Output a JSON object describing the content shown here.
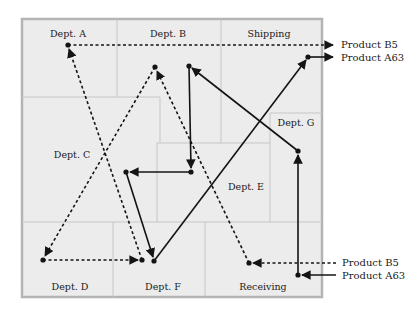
{
  "diagram": {
    "title": "",
    "colors": {
      "floor": "#ececec",
      "border": "#b4b4b4",
      "walls": "#c8c8c8",
      "path": "#141414"
    },
    "departments": [
      {
        "id": "dept-a",
        "label": "Dept. A",
        "x": 68,
        "y": 37
      },
      {
        "id": "dept-b",
        "label": "Dept. B",
        "x": 168,
        "y": 37
      },
      {
        "id": "shipping",
        "label": "Shipping",
        "x": 269,
        "y": 37
      },
      {
        "id": "dept-g",
        "label": "Dept. G",
        "x": 296,
        "y": 126
      },
      {
        "id": "dept-c",
        "label": "Dept. C",
        "x": 72,
        "y": 158
      },
      {
        "id": "dept-e",
        "label": "Dept. E",
        "x": 246,
        "y": 190
      },
      {
        "id": "dept-d",
        "label": "Dept. D",
        "x": 70,
        "y": 290
      },
      {
        "id": "dept-f",
        "label": "Dept. F",
        "x": 163,
        "y": 290
      },
      {
        "id": "receiving",
        "label": "Receiving",
        "x": 263,
        "y": 290
      }
    ],
    "products": [
      {
        "name": "Product B5",
        "line_style": "dotted",
        "entry_label": "Product B5",
        "exit_label": "Product B5",
        "route": [
          "Receiving",
          "Dept. B",
          "Dept. D",
          "Dept. F",
          "Dept. A",
          "Shipping"
        ],
        "points": [
          [
            336,
            263
          ],
          [
            249,
            263
          ],
          [
            155,
            67
          ],
          [
            43,
            260
          ],
          [
            142,
            260
          ],
          [
            68,
            45
          ],
          [
            333,
            45
          ]
        ]
      },
      {
        "name": "Product A63",
        "line_style": "solid",
        "entry_label": "Product A63",
        "exit_label": "Product A63",
        "route": [
          "Receiving",
          "Dept. G",
          "Dept. B",
          "Dept. E",
          "Dept. C",
          "Dept. F",
          "Shipping"
        ],
        "points": [
          [
            336,
            275
          ],
          [
            298,
            275
          ],
          [
            298,
            151
          ],
          [
            189,
            66
          ],
          [
            191,
            172
          ],
          [
            126,
            172
          ],
          [
            154,
            261
          ],
          [
            308,
            57
          ],
          [
            333,
            57
          ]
        ]
      }
    ],
    "side_labels": {
      "top_b5": "Product B5",
      "top_a63": "Product A63",
      "bottom_b5": "Product B5",
      "bottom_a63": "Product A63"
    }
  }
}
